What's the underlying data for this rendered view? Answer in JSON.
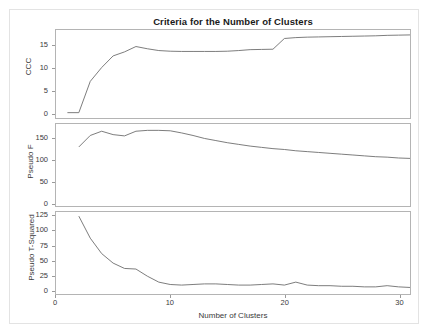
{
  "figure": {
    "title": "Criteria for the Number of Clusters",
    "xlabel": "Number of Clusters",
    "background": "#ffffff",
    "line_color": "#6e6e6e",
    "frame_color": "#b4b4b4"
  },
  "axes": {
    "x_ticks": [
      "0",
      "10",
      "20",
      "30"
    ],
    "ccc_ticks": [
      "0",
      "5",
      "10",
      "15"
    ],
    "f_ticks": [
      "0",
      "50",
      "100",
      "150"
    ],
    "t2_ticks": [
      "0",
      "25",
      "50",
      "75",
      "100",
      "125"
    ],
    "ccc_label": "CCC",
    "f_label": "Pseudo F",
    "t2_label": "Pseudo T-Squared"
  },
  "chart_data": [
    {
      "type": "line",
      "title": "Criteria for the Number of Clusters",
      "panel": "CCC",
      "xlabel": "Number of Clusters",
      "ylabel": "CCC",
      "xlim": [
        0,
        31
      ],
      "ylim": [
        -1.2,
        18.5
      ],
      "xticks": [
        0,
        10,
        20,
        30
      ],
      "yticks": [
        0,
        5,
        10,
        15
      ],
      "grid": false,
      "legend": "none",
      "x": [
        1,
        2,
        3,
        4,
        5,
        6,
        7,
        8,
        9,
        10,
        11,
        12,
        13,
        14,
        15,
        16,
        17,
        18,
        19,
        20,
        21,
        22,
        23,
        24,
        25,
        26,
        27,
        28,
        29,
        30,
        31
      ],
      "values": [
        0.0,
        0.0,
        7.0,
        10.1,
        12.7,
        13.6,
        14.8,
        14.3,
        13.9,
        13.75,
        13.7,
        13.7,
        13.7,
        13.7,
        13.75,
        13.9,
        14.1,
        14.15,
        14.2,
        16.6,
        16.8,
        16.9,
        16.95,
        17.0,
        17.05,
        17.1,
        17.15,
        17.2,
        17.3,
        17.35,
        17.4
      ]
    },
    {
      "type": "line",
      "panel": "Pseudo F",
      "xlabel": "Number of Clusters",
      "ylabel": "Pseudo F",
      "xlim": [
        0,
        31
      ],
      "ylim": [
        -8,
        185
      ],
      "xticks": [
        0,
        10,
        20,
        30
      ],
      "yticks": [
        0,
        50,
        100,
        150
      ],
      "grid": false,
      "legend": "none",
      "x": [
        2,
        3,
        4,
        5,
        6,
        7,
        8,
        9,
        10,
        11,
        12,
        13,
        14,
        15,
        16,
        17,
        18,
        19,
        20,
        21,
        22,
        23,
        24,
        25,
        26,
        27,
        28,
        29,
        30,
        31
      ],
      "values": [
        131,
        158,
        168,
        160,
        157,
        168,
        170,
        170,
        169,
        164,
        158,
        151,
        146,
        141,
        137,
        133,
        130,
        127,
        125,
        122,
        120,
        118,
        116,
        114,
        112,
        110,
        108,
        107,
        105,
        104
      ]
    },
    {
      "type": "line",
      "panel": "Pseudo T-Squared",
      "xlabel": "Number of Clusters",
      "ylabel": "Pseudo T-Squared",
      "xlim": [
        0,
        31
      ],
      "ylim": [
        -6,
        132
      ],
      "xticks": [
        0,
        10,
        20,
        30
      ],
      "yticks": [
        0,
        25,
        50,
        75,
        100,
        125
      ],
      "grid": false,
      "legend": "none",
      "x": [
        2,
        3,
        4,
        5,
        6,
        7,
        8,
        9,
        10,
        11,
        12,
        13,
        14,
        15,
        16,
        17,
        18,
        19,
        20,
        21,
        22,
        23,
        24,
        25,
        26,
        27,
        28,
        29,
        30,
        31
      ],
      "values": [
        125,
        88,
        62,
        46,
        37,
        36,
        24,
        14,
        10,
        9,
        10,
        11,
        11,
        10,
        9,
        9,
        10,
        11,
        9,
        14,
        9,
        8,
        8,
        7,
        7,
        6,
        6,
        8,
        6,
        5
      ]
    }
  ]
}
